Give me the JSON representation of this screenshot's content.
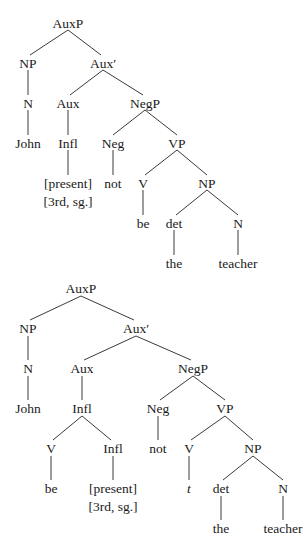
{
  "diagram": {
    "type": "syntax-tree-pair",
    "trees": [
      {
        "id": "tree-1",
        "nodes": [
          {
            "id": "auxp",
            "label": "AuxP",
            "x": 68,
            "y": 25
          },
          {
            "id": "np",
            "label": "NP",
            "x": 28,
            "y": 65
          },
          {
            "id": "auxbar",
            "label": "Aux′",
            "x": 103,
            "y": 65
          },
          {
            "id": "n",
            "label": "N",
            "x": 28,
            "y": 105
          },
          {
            "id": "aux",
            "label": "Aux",
            "x": 68,
            "y": 105
          },
          {
            "id": "negp",
            "label": "NegP",
            "x": 145,
            "y": 105
          },
          {
            "id": "john",
            "label": "John",
            "x": 28,
            "y": 145
          },
          {
            "id": "infl",
            "label": "Infl",
            "x": 68,
            "y": 145
          },
          {
            "id": "neg",
            "label": "Neg",
            "x": 113,
            "y": 145
          },
          {
            "id": "vp",
            "label": "VP",
            "x": 177,
            "y": 145
          },
          {
            "id": "present",
            "label": "[present]",
            "x": 68,
            "y": 185
          },
          {
            "id": "thirdsg",
            "label": "[3rd, sg.]",
            "x": 68,
            "y": 203
          },
          {
            "id": "not",
            "label": "not",
            "x": 113,
            "y": 185
          },
          {
            "id": "v",
            "label": "V",
            "x": 143,
            "y": 185
          },
          {
            "id": "np2",
            "label": "NP",
            "x": 207,
            "y": 185
          },
          {
            "id": "be",
            "label": "be",
            "x": 143,
            "y": 225
          },
          {
            "id": "det",
            "label": "det",
            "x": 174,
            "y": 225
          },
          {
            "id": "n2",
            "label": "N",
            "x": 238,
            "y": 225
          },
          {
            "id": "the",
            "label": "the",
            "x": 174,
            "y": 265
          },
          {
            "id": "teacher",
            "label": "teacher",
            "x": 238,
            "y": 265
          }
        ],
        "edges": [
          [
            68,
            30,
            30,
            55
          ],
          [
            68,
            30,
            101,
            55
          ],
          [
            28,
            70,
            28,
            95
          ],
          [
            103,
            70,
            70,
            95
          ],
          [
            103,
            70,
            143,
            95
          ],
          [
            28,
            110,
            28,
            135
          ],
          [
            68,
            110,
            68,
            135
          ],
          [
            145,
            110,
            113,
            135
          ],
          [
            145,
            110,
            177,
            135
          ],
          [
            68,
            150,
            68,
            175
          ],
          [
            113,
            150,
            113,
            175
          ],
          [
            177,
            150,
            145,
            175
          ],
          [
            177,
            150,
            207,
            175
          ],
          [
            143,
            190,
            143,
            215
          ],
          [
            207,
            190,
            176,
            215
          ],
          [
            207,
            190,
            238,
            215
          ],
          [
            174,
            230,
            174,
            255
          ],
          [
            238,
            230,
            238,
            255
          ]
        ]
      },
      {
        "id": "tree-2",
        "nodes": [
          {
            "id": "auxp",
            "label": "AuxP",
            "x": 81,
            "y": 290
          },
          {
            "id": "np",
            "label": "NP",
            "x": 28,
            "y": 330
          },
          {
            "id": "auxbar",
            "label": "Aux′",
            "x": 136,
            "y": 330
          },
          {
            "id": "n",
            "label": "N",
            "x": 28,
            "y": 370
          },
          {
            "id": "aux",
            "label": "Aux",
            "x": 82,
            "y": 370
          },
          {
            "id": "negp",
            "label": "NegP",
            "x": 193,
            "y": 370
          },
          {
            "id": "john",
            "label": "John",
            "x": 28,
            "y": 410
          },
          {
            "id": "infl",
            "label": "Infl",
            "x": 82,
            "y": 410
          },
          {
            "id": "neg",
            "label": "Neg",
            "x": 158,
            "y": 410
          },
          {
            "id": "vp",
            "label": "VP",
            "x": 225,
            "y": 410
          },
          {
            "id": "v",
            "label": "V",
            "x": 51,
            "y": 450
          },
          {
            "id": "infl2",
            "label": "Infl",
            "x": 113,
            "y": 450
          },
          {
            "id": "not",
            "label": "not",
            "x": 158,
            "y": 450
          },
          {
            "id": "v2",
            "label": "V",
            "x": 189,
            "y": 450
          },
          {
            "id": "np2",
            "label": "NP",
            "x": 253,
            "y": 450
          },
          {
            "id": "be",
            "label": "be",
            "x": 51,
            "y": 490
          },
          {
            "id": "present",
            "label": "[present]",
            "x": 113,
            "y": 490
          },
          {
            "id": "thirdsg",
            "label": "[3rd, sg.]",
            "x": 113,
            "y": 508
          },
          {
            "id": "trace",
            "label": "t",
            "x": 189,
            "y": 490,
            "italic": true
          },
          {
            "id": "det",
            "label": "det",
            "x": 221,
            "y": 490
          },
          {
            "id": "n2",
            "label": "N",
            "x": 283,
            "y": 490
          },
          {
            "id": "the",
            "label": "the",
            "x": 221,
            "y": 530
          },
          {
            "id": "teacher",
            "label": "teacher",
            "x": 283,
            "y": 530
          }
        ],
        "edges": [
          [
            81,
            296,
            30,
            320
          ],
          [
            81,
            296,
            134,
            320
          ],
          [
            28,
            336,
            28,
            360
          ],
          [
            136,
            336,
            84,
            360
          ],
          [
            136,
            336,
            191,
            360
          ],
          [
            28,
            376,
            28,
            400
          ],
          [
            82,
            376,
            82,
            400
          ],
          [
            193,
            376,
            160,
            400
          ],
          [
            193,
            376,
            225,
            400
          ],
          [
            82,
            416,
            53,
            440
          ],
          [
            82,
            416,
            111,
            440
          ],
          [
            158,
            416,
            158,
            440
          ],
          [
            225,
            416,
            191,
            440
          ],
          [
            225,
            416,
            253,
            440
          ],
          [
            51,
            456,
            51,
            480
          ],
          [
            113,
            456,
            113,
            480
          ],
          [
            189,
            456,
            189,
            480
          ],
          [
            253,
            456,
            223,
            480
          ],
          [
            253,
            456,
            283,
            480
          ],
          [
            221,
            496,
            221,
            520
          ],
          [
            283,
            496,
            283,
            520
          ]
        ]
      }
    ]
  }
}
